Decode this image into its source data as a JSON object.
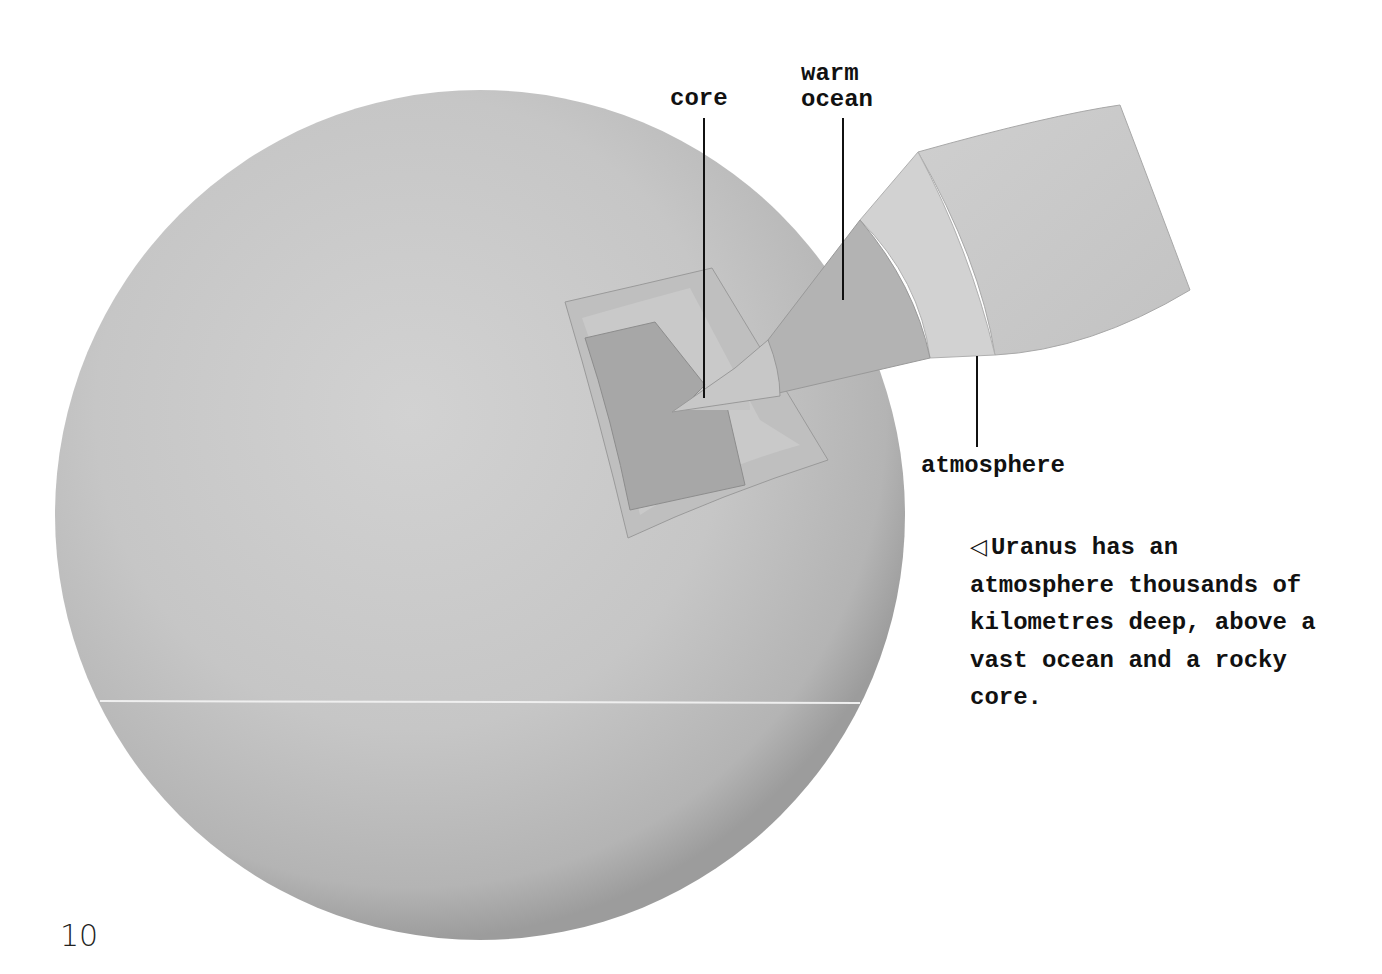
{
  "diagram": {
    "labels": {
      "core": "core",
      "warm_ocean": "warm\nocean",
      "atmosphere": "atmosphere"
    },
    "layers": [
      "core",
      "warm ocean",
      "atmosphere"
    ],
    "colors": {
      "planet_surface": "#c8c8c8",
      "planet_shadow": "#9a9a9a",
      "core": "#a9a9a9",
      "ocean": "#b4b4b4",
      "atmosphere": "#d0d0d0",
      "outer_shell": "#c6c6c6",
      "leader_lines": "#111111"
    }
  },
  "caption": {
    "arrow": "◁",
    "text": "Uranus has an atmosphere thousands of kilometres deep, above a vast ocean and a rocky core."
  },
  "page": {
    "number": "10"
  }
}
